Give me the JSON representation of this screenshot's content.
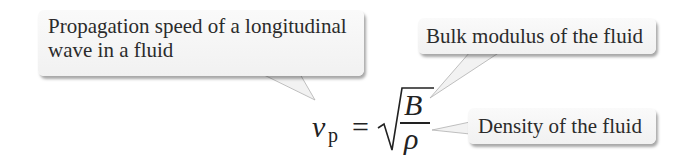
{
  "callouts": [
    {
      "id": "propagation-speed",
      "text_line1": "Propagation speed of a longitudinal",
      "text_line2": "wave in a fluid"
    },
    {
      "id": "bulk-modulus",
      "text": "Bulk modulus of the fluid"
    },
    {
      "id": "density",
      "text": "Density of the fluid"
    }
  ],
  "equation": {
    "lhs_symbol": "v",
    "lhs_subscript": "p",
    "equals": "=",
    "numerator": "B",
    "denominator": "ρ",
    "latex": "v_p = \\sqrt{B/\\rho}"
  },
  "colors": {
    "callout_bg": "#f5f5f5",
    "text": "#2b2b2b",
    "shadow": "#9a9a9a"
  }
}
